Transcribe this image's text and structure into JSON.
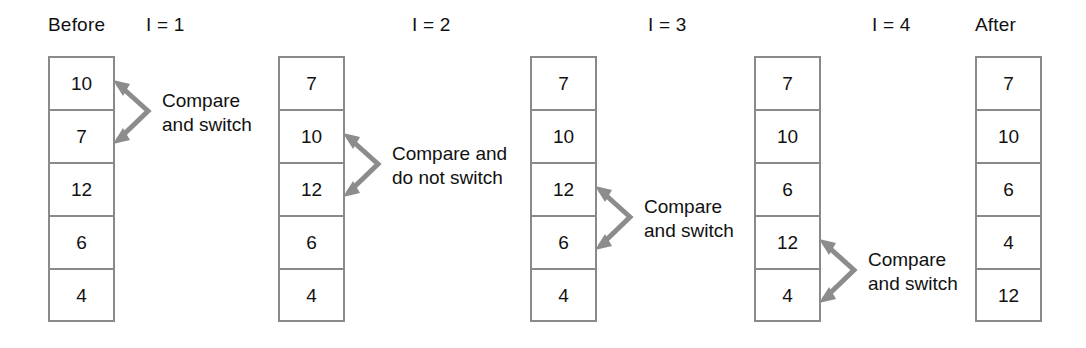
{
  "figure": {
    "box_border_color": "#8a8a8a",
    "arrow_color": "#8c8c8c",
    "text_color": "#111111",
    "background_color": "#ffffff"
  },
  "columns": [
    {
      "header": "Before",
      "values": [
        "10",
        "7",
        "12",
        "6",
        "4"
      ],
      "annotation": {
        "lines": [
          "Compare",
          "and switch"
        ],
        "from_index": 0,
        "to_index": 1
      }
    },
    {
      "header": "I  =  1",
      "values": [
        "7",
        "10",
        "12",
        "6",
        "4"
      ],
      "annotation": {
        "lines": [
          "Compare and",
          "do not switch"
        ],
        "from_index": 1,
        "to_index": 2
      }
    },
    {
      "header": "I  =  2",
      "values": [
        "7",
        "10",
        "12",
        "6",
        "4"
      ],
      "annotation": {
        "lines": [
          "Compare",
          "and switch"
        ],
        "from_index": 2,
        "to_index": 3
      }
    },
    {
      "header": "I  =  3",
      "values": [
        "7",
        "10",
        "6",
        "12",
        "4"
      ],
      "annotation": {
        "lines": [
          "Compare",
          "and switch"
        ],
        "from_index": 3,
        "to_index": 4
      }
    },
    {
      "header": "I  =  4",
      "values": [
        "7",
        "10",
        "6",
        "4",
        "12"
      ],
      "annotation": null
    },
    {
      "header": "After",
      "values": null,
      "annotation": null
    }
  ],
  "stacks": [
    {
      "label": "before-stack",
      "values": [
        "10",
        "7",
        "12",
        "6",
        "4"
      ]
    },
    {
      "label": "pass1-stack",
      "values": [
        "7",
        "10",
        "12",
        "6",
        "4"
      ]
    },
    {
      "label": "pass2-stack",
      "values": [
        "7",
        "10",
        "12",
        "6",
        "4"
      ]
    },
    {
      "label": "pass3-stack",
      "values": [
        "7",
        "10",
        "6",
        "12",
        "4"
      ]
    },
    {
      "label": "after-stack",
      "values": [
        "7",
        "10",
        "6",
        "4",
        "12"
      ]
    }
  ],
  "headers": {
    "before": "Before",
    "i1": "I  =  1",
    "i2": "I  =  2",
    "i3": "I  =  3",
    "i4": "I  =  4",
    "after": "After"
  },
  "annotations": [
    {
      "line1": "Compare",
      "line2": "and switch"
    },
    {
      "line1": "Compare and",
      "line2": "do not switch"
    },
    {
      "line1": "Compare",
      "line2": "and switch"
    },
    {
      "line1": "Compare",
      "line2": "and switch"
    }
  ]
}
